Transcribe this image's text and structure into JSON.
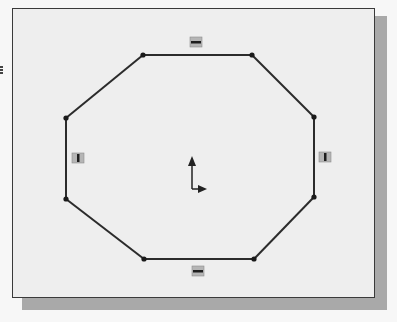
{
  "sketch": {
    "view": "2D sketch viewport",
    "background_color": "#eeeeee",
    "frame_border_color": "#3a3a3a",
    "shadow_color": "#a9a9a9",
    "line_color": "#2b2b2b",
    "shape": "octagon",
    "vertices": [
      [
        143,
        55
      ],
      [
        252,
        55
      ],
      [
        314,
        117
      ],
      [
        314,
        197
      ],
      [
        254,
        259
      ],
      [
        144,
        259
      ],
      [
        66,
        199
      ],
      [
        66,
        118
      ]
    ],
    "constraints": [
      {
        "type": "horizontal",
        "icon": "horizontal-constraint-icon",
        "x": 196,
        "y": 42
      },
      {
        "type": "horizontal",
        "icon": "horizontal-constraint-icon",
        "x": 198,
        "y": 271
      },
      {
        "type": "vertical",
        "icon": "vertical-constraint-icon",
        "x": 78,
        "y": 158
      },
      {
        "type": "vertical",
        "icon": "vertical-constraint-icon",
        "x": 325,
        "y": 157
      }
    ],
    "origin": {
      "x": 192,
      "y": 189,
      "icon": "sketch-origin-axes-icon"
    }
  }
}
